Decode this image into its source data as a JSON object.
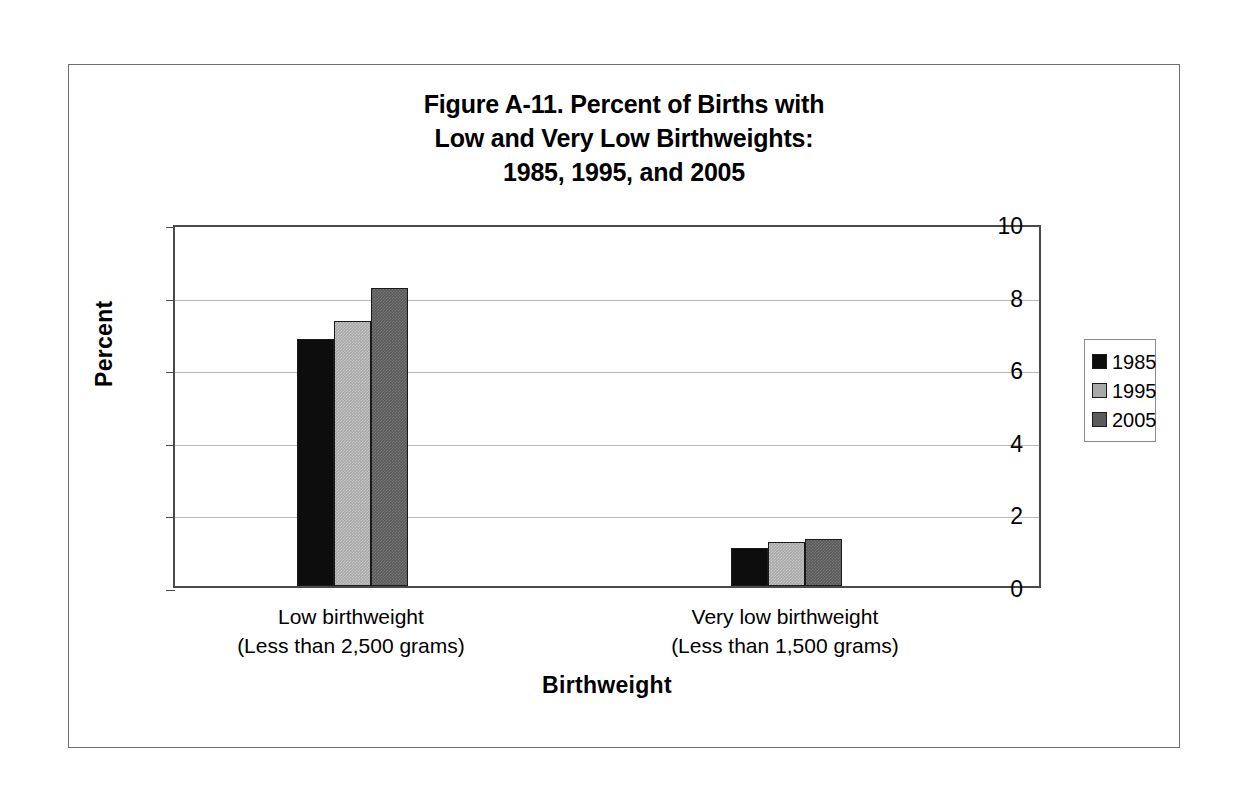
{
  "figure": {
    "title_lines": [
      "Figure A-11. Percent of Births with",
      "Low and Very Low Birthweights:",
      "1985, 1995, and 2005"
    ]
  },
  "chart_data": {
    "type": "bar",
    "title": "Figure A-11. Percent of Births with Low and Very Low Birthweights: 1985, 1995, and 2005",
    "xlabel": "Birthweight",
    "ylabel": "Percent",
    "ylim": [
      0,
      10
    ],
    "ytick_labels": [
      "0",
      "2",
      "4",
      "6",
      "8",
      "10"
    ],
    "ytick_values": [
      0,
      2,
      4,
      6,
      8,
      10
    ],
    "grid": "horizontal",
    "legend_position": "right",
    "categories": [
      "Low birthweight (Less than 2,500 grams)",
      "Very low birthweight (Less than 1,500 grams)"
    ],
    "category_lines": [
      [
        "Low birthweight",
        "(Less than 2,500 grams)"
      ],
      [
        "Very low birthweight",
        "(Less than 1,500 grams)"
      ]
    ],
    "series": [
      {
        "name": "1985",
        "color": "#0d0d0d",
        "values": [
          6.8,
          1.05
        ]
      },
      {
        "name": "1995",
        "color": "#a9a9a9",
        "values": [
          7.3,
          1.2
        ]
      },
      {
        "name": "2005",
        "color": "#5b5b5b",
        "values": [
          8.2,
          1.3
        ]
      }
    ]
  },
  "legend": {
    "entries": [
      {
        "label": "1985",
        "color": "#0d0d0d"
      },
      {
        "label": "1995",
        "color": "#a9a9a9"
      },
      {
        "label": "2005",
        "color": "#5b5b5b"
      }
    ]
  }
}
